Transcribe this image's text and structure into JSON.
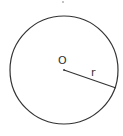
{
  "diagram": {
    "type": "circle-geometry",
    "center_label": "O",
    "radius_label": "r",
    "stroke_color": "#333333",
    "background_color": "#ffffff"
  }
}
